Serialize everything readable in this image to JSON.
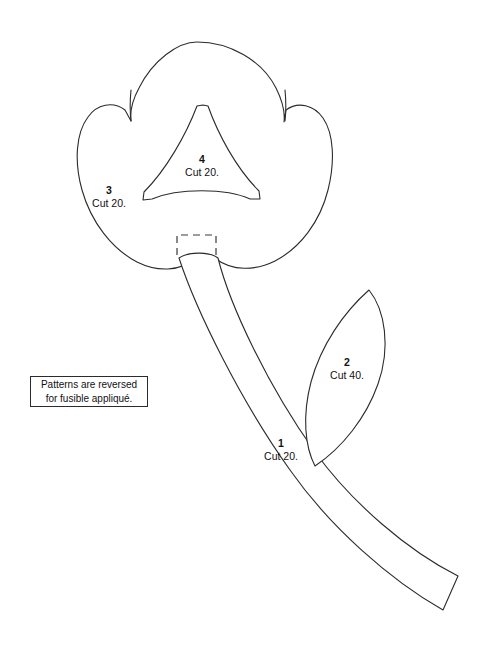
{
  "page": {
    "background_color": "#ffffff",
    "line_color": "#2b2b2b",
    "text_color": "#111111",
    "width": 485,
    "height": 650
  },
  "note_box": {
    "line1": "Patterns are reversed",
    "line2": "for fusible appliqué."
  },
  "pieces": [
    {
      "id": "stem",
      "number": "1",
      "cut": "Cut 20.",
      "shape_name": "curved-stem"
    },
    {
      "id": "leaf",
      "number": "2",
      "cut": "Cut 40.",
      "shape_name": "pointed-leaf"
    },
    {
      "id": "flower",
      "number": "3",
      "cut": "Cut 20.",
      "shape_name": "three-lobed-flower"
    },
    {
      "id": "center",
      "number": "4",
      "cut": "Cut 20.",
      "shape_name": "concave-triangle-center"
    }
  ]
}
